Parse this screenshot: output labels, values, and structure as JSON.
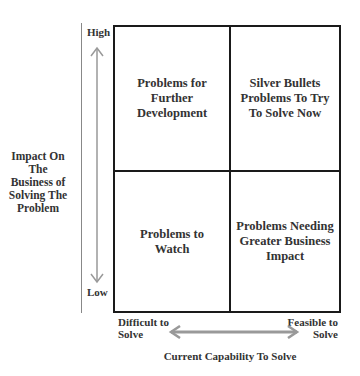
{
  "diagram": {
    "type": "2x2 matrix",
    "y_axis": {
      "title": "Impact On The Business of Solving The Problem",
      "title_lines": [
        "Impact On",
        "The",
        "Business of",
        "Solving The",
        "Problem"
      ],
      "high_label": "High",
      "low_label": "Low"
    },
    "x_axis": {
      "title": "Current Capability To Solve",
      "left_label_lines": [
        "Difficult to",
        "Solve"
      ],
      "right_label_lines": [
        "Feasible to",
        "Solve"
      ]
    },
    "quadrants": {
      "top_left": {
        "lines": [
          "Problems for",
          "Further",
          "Development"
        ]
      },
      "top_right": {
        "lines": [
          "Silver Bullets",
          "Problems To Try",
          "To Solve Now"
        ]
      },
      "bottom_left": {
        "lines": [
          "Problems to",
          "Watch"
        ]
      },
      "bottom_right": {
        "lines": [
          "Problems Needing",
          "Greater Business",
          "Impact"
        ]
      }
    },
    "colors": {
      "grid_line": "#1a1a1a",
      "arrow": "#999999",
      "text": "#333333"
    }
  }
}
